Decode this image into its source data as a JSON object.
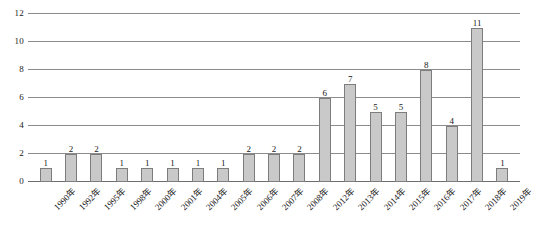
{
  "chart_data": {
    "type": "bar",
    "title": "",
    "subtitle": "",
    "xlabel": "",
    "ylabel": "",
    "ylim": [
      0,
      12
    ],
    "yticks": [
      0,
      2,
      4,
      6,
      8,
      10,
      12
    ],
    "grid": true,
    "legend": "none",
    "show_value_labels": true,
    "bar_color": "#c9c9c9",
    "bar_border_color": "#7d7d7d",
    "gridline_color": "#8c8c8c",
    "axis_color": "#6e6e6e",
    "categories": [
      "1990年",
      "1992年",
      "1995年",
      "1998年",
      "2000年",
      "2001年",
      "2004年",
      "2005年",
      "2006年",
      "2007年",
      "2008年",
      "2012年",
      "2013年",
      "2014年",
      "2015年",
      "2016年",
      "2017年",
      "2018年",
      "2019年"
    ],
    "values": [
      1,
      2,
      2,
      1,
      1,
      1,
      1,
      1,
      2,
      2,
      2,
      6,
      7,
      5,
      5,
      8,
      4,
      11,
      1
    ]
  }
}
